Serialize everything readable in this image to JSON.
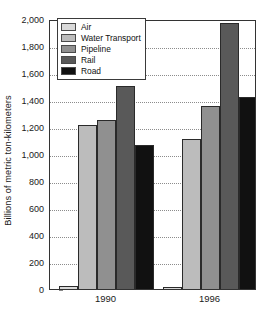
{
  "chart_data": {
    "type": "bar",
    "title": "",
    "subtitle": "",
    "xlabel": "",
    "ylabel": "Billions of metric ton-kilometers",
    "categories": [
      "1990",
      "1996"
    ],
    "series": [
      {
        "name": "Air",
        "values": [
          20,
          18
        ],
        "color": "#d9d9d9"
      },
      {
        "name": "Water Transport",
        "values": [
          1215,
          1110
        ],
        "color": "#bcbcbc"
      },
      {
        "name": "Pipeline",
        "values": [
          1255,
          1355
        ],
        "color": "#909090"
      },
      {
        "name": "Rail",
        "values": [
          1505,
          1970
        ],
        "color": "#595959"
      },
      {
        "name": "Road",
        "values": [
          1065,
          1425
        ],
        "color": "#111111"
      }
    ],
    "ylim": [
      0,
      2000
    ],
    "y_tick_step": 200,
    "y_ticks": [
      {
        "value": 0,
        "label": "0"
      },
      {
        "value": 200,
        "label": "200"
      },
      {
        "value": 400,
        "label": "400"
      },
      {
        "value": 600,
        "label": "600"
      },
      {
        "value": 800,
        "label": "800"
      },
      {
        "value": 1000,
        "label": "1,000"
      },
      {
        "value": 1200,
        "label": "1,200"
      },
      {
        "value": 1400,
        "label": "1,400"
      },
      {
        "value": 1600,
        "label": "1,600"
      },
      {
        "value": 1800,
        "label": "1,800"
      },
      {
        "value": 2000,
        "label": "2,000"
      }
    ],
    "grid": {
      "horizontal": true,
      "vertical": false,
      "style": "dotted",
      "color": "#8c8c8c"
    },
    "legend": {
      "position": "top-left",
      "entries": [
        "Air",
        "Water Transport",
        "Pipeline",
        "Rail",
        "Road"
      ]
    },
    "frame": true,
    "background": "#ffffff"
  }
}
